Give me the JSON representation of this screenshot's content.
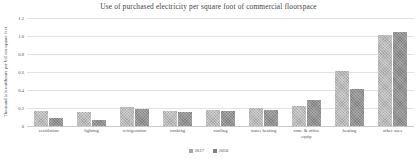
{
  "chart_data": {
    "type": "bar",
    "title": "Use of purchased electricity per square foot of commercial floorspace",
    "xlabel": "",
    "ylabel": "Thousand kilowatthours per billion square feet",
    "ylim": [
      0,
      1.2
    ],
    "yticks": [
      "0",
      "0.2",
      "0.4",
      "0.6",
      "0.8",
      "1.0",
      "1.2"
    ],
    "ytick_values": [
      0,
      0.2,
      0.4,
      0.6,
      0.8,
      1.0,
      1.2
    ],
    "grid": true,
    "legend_position": "bottom",
    "categories": [
      "ventilation",
      "lighting",
      "refrigeration",
      "cooking",
      "cooling",
      "water heating",
      "com. & office equip",
      "heating",
      "other uses"
    ],
    "category_lines": [
      [
        "ventilation"
      ],
      [
        "lighting"
      ],
      [
        "refrigeration"
      ],
      [
        "cooking"
      ],
      [
        "cooling"
      ],
      [
        "water heating"
      ],
      [
        "com. & office",
        "equip"
      ],
      [
        "heating"
      ],
      [
        "other uses"
      ]
    ],
    "series": [
      {
        "name": "2017",
        "color": "#a6a6a6",
        "values": [
          0.17,
          0.16,
          0.21,
          0.165,
          0.18,
          0.2,
          0.22,
          0.61,
          1.01
        ]
      },
      {
        "name": "2050",
        "color": "#808080",
        "values": [
          0.09,
          0.07,
          0.19,
          0.16,
          0.165,
          0.18,
          0.29,
          0.41,
          1.04
        ]
      }
    ]
  },
  "legend": {
    "items": [
      {
        "label": "2017"
      },
      {
        "label": "2050"
      }
    ]
  }
}
